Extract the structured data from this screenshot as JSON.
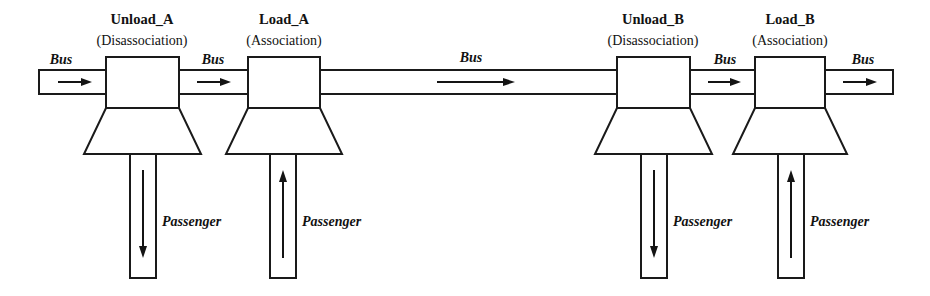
{
  "diagram": {
    "background_color": "#ffffff",
    "line_color": "#1a1a1a",
    "width": 930,
    "height": 296
  },
  "nodes": [
    {
      "id": "unload_a",
      "title": "Unload_A",
      "subtitle": "(Disassociation)",
      "passenger_direction": "down"
    },
    {
      "id": "load_a",
      "title": "Load_A",
      "subtitle": "(Association)",
      "passenger_direction": "up"
    },
    {
      "id": "unload_b",
      "title": "Unload_B",
      "subtitle": "(Disassociation)",
      "passenger_direction": "down"
    },
    {
      "id": "load_b",
      "title": "Load_B",
      "subtitle": "(Association)",
      "passenger_direction": "up"
    }
  ],
  "bus_segments": [
    {
      "id": "bus_in",
      "label": "Bus",
      "direction": "right"
    },
    {
      "id": "bus_a_to_load_a",
      "label": "Bus",
      "direction": "right"
    },
    {
      "id": "bus_middle",
      "label": "Bus",
      "direction": "right"
    },
    {
      "id": "bus_b_to_load_b",
      "label": "Bus",
      "direction": "right"
    },
    {
      "id": "bus_out",
      "label": "Bus",
      "direction": "right"
    }
  ],
  "passenger_flows": [
    {
      "id": "passenger_unload_a",
      "label": "Passenger",
      "direction": "down"
    },
    {
      "id": "passenger_load_a",
      "label": "Passenger",
      "direction": "up"
    },
    {
      "id": "passenger_unload_b",
      "label": "Passenger",
      "direction": "down"
    },
    {
      "id": "passenger_load_b",
      "label": "Passenger",
      "direction": "up"
    }
  ]
}
